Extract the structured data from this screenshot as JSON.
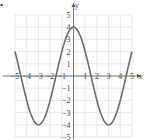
{
  "chart_data": {
    "type": "line",
    "title": "",
    "xlabel": "x",
    "ylabel": "y",
    "xlim": [
      -5,
      5
    ],
    "ylim": [
      -5,
      5
    ],
    "grid": true,
    "x_ticks": [
      "-5",
      "-4",
      "-3",
      "-2",
      "-1",
      "1",
      "2",
      "3",
      "4",
      "5"
    ],
    "y_ticks": [
      "5",
      "4",
      "3",
      "2",
      "1",
      "-1",
      "-2",
      "-3",
      "-4",
      "-5"
    ],
    "series": [
      {
        "name": "y = 4cos(πx/3)",
        "x": [
          -5,
          -4.5,
          -4,
          -3,
          -2,
          -1.5,
          -1,
          0,
          1,
          1.5,
          2,
          3,
          4,
          4.5,
          5
        ],
        "values": [
          2,
          0,
          -2,
          -4,
          -2,
          0,
          2,
          4,
          2,
          0,
          -2,
          -4,
          -2,
          0,
          2
        ]
      }
    ],
    "marker": "•"
  },
  "labels": {
    "x_axis": "x",
    "y_axis": "y",
    "bullet": "•"
  }
}
